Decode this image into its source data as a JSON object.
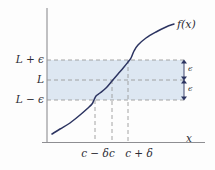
{
  "figure": {
    "axis_labels": {
      "x": "x",
      "function": "f(x)"
    },
    "y_ticks": [
      {
        "label": "L + ϵ",
        "value": "L+epsilon",
        "y_px": 60
      },
      {
        "label": "L",
        "value": "L",
        "y_px": 80
      },
      {
        "label": "L − ϵ",
        "value": "L-epsilon",
        "y_px": 100
      }
    ],
    "x_ticks": [
      {
        "label": "c − δ",
        "value": "c-delta",
        "x_px": 95
      },
      {
        "label": "c",
        "value": "c",
        "x_px": 112
      },
      {
        "label": "c + δ",
        "value": "c+delta",
        "x_px": 128
      }
    ],
    "epsilon_markers": [
      {
        "label": "ϵ",
        "from": "L + ϵ",
        "to": "L"
      },
      {
        "label": "ϵ",
        "from": "L",
        "to": "L − ϵ"
      }
    ],
    "colors": {
      "curve": "#2c3461",
      "band_fill": "#dde7f2",
      "dashed_guide": "#9a9a9a",
      "axis": "#8e8e92",
      "text": "#2b2b33"
    }
  },
  "chart_data": {
    "type": "line",
    "title": "",
    "subtitle": "",
    "xlabel": "x",
    "ylabel": "",
    "xlim": [
      46,
      210
    ],
    "ylim": [
      142,
      10
    ],
    "grid": false,
    "legend": null,
    "annotations": [
      {
        "text": "f(x)",
        "x_px": 182,
        "y_px": 26
      },
      {
        "text": "x",
        "x_px": 188,
        "y_px": 140
      },
      {
        "text": "ϵ",
        "x_px": 187,
        "y_px": 70
      },
      {
        "text": "ϵ",
        "x_px": 187,
        "y_px": 90
      }
    ],
    "shaded_band": {
      "y_top": 60,
      "y_bottom": 100,
      "x_from": 46,
      "x_to": 184
    },
    "series": [
      {
        "name": "f(x)",
        "points": [
          [
            52,
            134
          ],
          [
            60,
            129
          ],
          [
            70,
            123
          ],
          [
            80,
            115
          ],
          [
            88,
            108
          ],
          [
            92,
            104
          ],
          [
            94,
            100
          ],
          [
            96,
            96
          ],
          [
            100,
            93
          ],
          [
            106,
            88
          ],
          [
            112,
            81
          ],
          [
            118,
            74
          ],
          [
            124,
            67
          ],
          [
            128,
            62
          ],
          [
            131,
            58
          ],
          [
            134,
            51
          ],
          [
            138,
            45
          ],
          [
            146,
            38
          ],
          [
            156,
            32
          ],
          [
            166,
            27
          ],
          [
            174,
            24
          ]
        ]
      }
    ],
    "y_tick_values": [
      "L + ϵ",
      "L",
      "L − ϵ"
    ],
    "x_tick_values": [
      "c − δ",
      "c",
      "c + δ"
    ]
  }
}
